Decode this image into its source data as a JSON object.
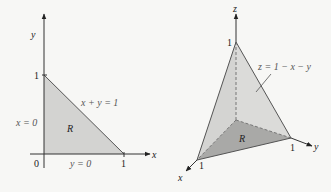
{
  "figure_left": {
    "title": "Region R in the xy-plane",
    "axis_x_label": "x",
    "axis_y_label": "y",
    "origin_label": "0",
    "tick_x_label": "1",
    "tick_y_label": "1",
    "region_label": "R",
    "hypotenuse_label": "x + y = 1",
    "left_edge_label": "x = 0",
    "bottom_edge_label": "y = 0",
    "region_fill": "#d3d3d1",
    "edge_color": "#555555"
  },
  "figure_right": {
    "title": "Tetrahedron under z = 1 - x - y",
    "axis_x_label": "x",
    "axis_y_label": "y",
    "axis_z_label": "z",
    "tick_x_label": "1",
    "tick_y_label": "1",
    "tick_z_label": "1",
    "region_label": "R",
    "surface_label": "z = 1 − x − y",
    "surface_fill": "#d6d6d4",
    "base_fill": "#a9a9a7",
    "edge_color": "#555555"
  }
}
